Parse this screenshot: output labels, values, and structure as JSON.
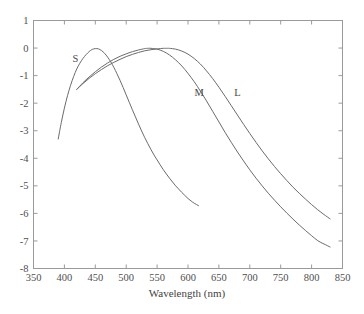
{
  "chart_data": {
    "type": "line",
    "title": "",
    "xlabel": "Wavelength (nm)",
    "ylabel": "",
    "xlim": [
      350,
      850
    ],
    "ylim": [
      -8,
      1
    ],
    "xticks": [
      350,
      400,
      450,
      500,
      550,
      600,
      650,
      700,
      750,
      800,
      850
    ],
    "xticklabels": [
      "350",
      "400",
      "450",
      "500",
      "550",
      "600",
      "650",
      "700",
      "750",
      "800",
      "850"
    ],
    "yticks": [
      1,
      0,
      -1,
      -2,
      -3,
      -4,
      -5,
      -6,
      -7,
      -8
    ],
    "yticklabels": [
      "1",
      "0",
      "-1",
      "-2",
      "-3",
      "-4",
      "-5",
      "-6",
      "-7",
      "-8"
    ],
    "grid": false,
    "legend_position": "inline-annotations",
    "annotations": [
      {
        "text": "S",
        "x": 418,
        "y": -0.5
      },
      {
        "text": "M",
        "x": 618,
        "y": -1.75
      },
      {
        "text": "L",
        "x": 680,
        "y": -1.75
      }
    ],
    "series": [
      {
        "name": "S",
        "label": "S",
        "color": "#6b6b6b",
        "x": [
          390,
          395,
          400,
          405,
          410,
          415,
          420,
          425,
          430,
          435,
          440,
          445,
          450,
          455,
          460,
          465,
          470,
          475,
          480,
          485,
          490,
          495,
          500,
          505,
          510,
          515,
          520,
          525,
          530,
          535,
          540,
          545,
          550,
          555,
          560,
          565,
          570,
          575,
          580,
          585,
          590,
          595,
          600,
          605,
          610,
          617
        ],
        "y": [
          -3.3,
          -2.7,
          -2.18,
          -1.73,
          -1.35,
          -1.03,
          -0.76,
          -0.55,
          -0.38,
          -0.24,
          -0.13,
          -0.05,
          -0.02,
          -0.03,
          -0.09,
          -0.19,
          -0.33,
          -0.5,
          -0.7,
          -0.93,
          -1.17,
          -1.43,
          -1.7,
          -1.97,
          -2.24,
          -2.5,
          -2.76,
          -3.01,
          -3.25,
          -3.47,
          -3.68,
          -3.88,
          -4.06,
          -4.24,
          -4.41,
          -4.57,
          -4.72,
          -4.86,
          -5.0,
          -5.12,
          -5.24,
          -5.35,
          -5.46,
          -5.55,
          -5.63,
          -5.72
        ]
      },
      {
        "name": "M",
        "label": "M",
        "color": "#6b6b6b",
        "x": [
          420,
          430,
          440,
          450,
          460,
          470,
          480,
          490,
          500,
          510,
          520,
          530,
          535,
          540,
          550,
          560,
          570,
          580,
          590,
          600,
          610,
          620,
          630,
          640,
          650,
          660,
          670,
          680,
          690,
          700,
          710,
          720,
          730,
          740,
          750,
          760,
          770,
          780,
          790,
          800,
          810,
          820,
          830
        ],
        "y": [
          -1.5,
          -1.26,
          -1.05,
          -0.86,
          -0.69,
          -0.54,
          -0.41,
          -0.3,
          -0.21,
          -0.13,
          -0.07,
          -0.02,
          -0.01,
          -0.01,
          -0.04,
          -0.12,
          -0.25,
          -0.43,
          -0.65,
          -0.92,
          -1.22,
          -1.56,
          -1.92,
          -2.3,
          -2.68,
          -3.06,
          -3.42,
          -3.77,
          -4.1,
          -4.42,
          -4.72,
          -5.0,
          -5.27,
          -5.52,
          -5.76,
          -5.99,
          -6.21,
          -6.42,
          -6.62,
          -6.81,
          -6.99,
          -7.11,
          -7.22
        ]
      },
      {
        "name": "L",
        "label": "L",
        "color": "#6b6b6b",
        "x": [
          420,
          430,
          440,
          450,
          460,
          470,
          480,
          490,
          500,
          510,
          520,
          530,
          540,
          550,
          560,
          565,
          570,
          580,
          590,
          600,
          610,
          620,
          630,
          640,
          650,
          660,
          670,
          680,
          690,
          700,
          710,
          720,
          730,
          740,
          750,
          760,
          770,
          780,
          790,
          800,
          810,
          820,
          830
        ],
        "y": [
          -1.5,
          -1.29,
          -1.1,
          -0.93,
          -0.78,
          -0.64,
          -0.52,
          -0.41,
          -0.31,
          -0.23,
          -0.16,
          -0.1,
          -0.06,
          -0.03,
          -0.01,
          -0.01,
          -0.01,
          -0.04,
          -0.11,
          -0.22,
          -0.38,
          -0.58,
          -0.83,
          -1.11,
          -1.42,
          -1.75,
          -2.09,
          -2.43,
          -2.77,
          -3.1,
          -3.42,
          -3.73,
          -4.02,
          -4.3,
          -4.56,
          -4.81,
          -5.05,
          -5.27,
          -5.48,
          -5.68,
          -5.87,
          -6.04,
          -6.2
        ]
      }
    ]
  },
  "figure": {
    "background_color": "#ffffff",
    "axis_color": "#9a9a9a",
    "curve_color": "#6b6b6b",
    "text_color": "#4a4a4a"
  }
}
